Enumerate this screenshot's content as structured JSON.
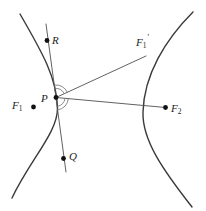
{
  "figure_labels": {
    "R": "R",
    "P": "P",
    "Q": "Q",
    "F1": {
      "base": "F",
      "sub": "1"
    },
    "F2": {
      "base": "F",
      "sub": "2"
    },
    "F1_prime": {
      "base": "F",
      "sub": "1",
      "prime": "′"
    }
  },
  "colors": {
    "background": "#ffffff",
    "curve": "#3a3a3a",
    "line": "#4f4f4f",
    "arc": "#7d7d7d",
    "dot": "#111111",
    "label": "#1c1c1c"
  }
}
